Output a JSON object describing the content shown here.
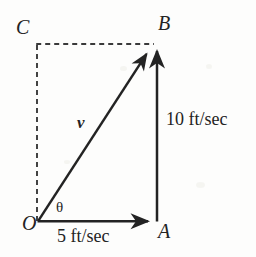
{
  "figure": {
    "type": "vector-diagram",
    "title": "",
    "background_color": "#fdfdfc",
    "stroke_color": "#232323",
    "points": {
      "origin_label": "O",
      "horizontal_tip_label": "A",
      "resultant_tip_label": "B",
      "vertical_tip_label": "C"
    },
    "vectors": {
      "resultant_label": "v",
      "angle_label": "θ",
      "vertical_component_label": "10 ft/sec",
      "horizontal_component_label": "5 ft/sec"
    },
    "geometry": {
      "origin": [
        38,
        221
      ],
      "point_a": [
        156,
        221
      ],
      "point_b": [
        156,
        44
      ],
      "point_c": [
        38,
        44
      ],
      "solid_edges": [
        "O-A",
        "A-B",
        "O-B"
      ],
      "dashed_edges": [
        "O-C",
        "C-B"
      ],
      "arrowheads": [
        "A",
        "B_vertical",
        "B_resultant"
      ]
    }
  }
}
